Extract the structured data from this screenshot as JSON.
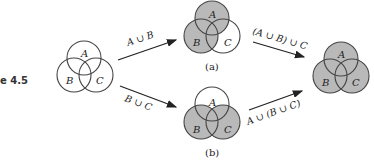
{
  "figure_label": "e 4.5",
  "shade_color": "#b9b9b9",
  "venn_initial": {
    "labels": {
      "a": "A",
      "b": "B",
      "c": "C"
    },
    "shaded": []
  },
  "venn_a": {
    "labels": {
      "a": "A",
      "b": "B",
      "c": "C"
    },
    "shaded": [
      "A",
      "B"
    ],
    "caption": "(a)"
  },
  "venn_b": {
    "labels": {
      "a": "A",
      "b": "B",
      "c": "C"
    },
    "shaded": [
      "B",
      "C"
    ],
    "caption": "(b)"
  },
  "venn_final": {
    "labels": {
      "a": "A",
      "b": "B",
      "c": "C"
    },
    "shaded": [
      "A",
      "B",
      "C"
    ]
  },
  "arrows": {
    "top_left": "A ∪ B",
    "bottom_left": "B ∪ C",
    "top_right": "(A ∪ B) ∪ C",
    "bottom_right": "A ∪ (B ∪ C)"
  }
}
